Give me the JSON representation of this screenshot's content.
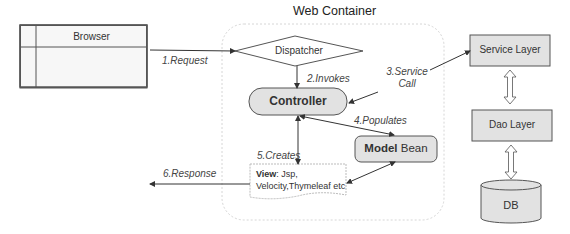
{
  "title": "Web Container",
  "browser": {
    "label": "Browser"
  },
  "dispatcher": {
    "label": "Dispatcher"
  },
  "controller": {
    "label": "Controller"
  },
  "model": {
    "bold": "Model",
    "rest": " Bean"
  },
  "view": {
    "bold": "View",
    "line1": ": Jsp,",
    "line2": "Velocity,Thymeleaf etc"
  },
  "service": {
    "label": "Service Layer"
  },
  "dao": {
    "label": "Dao Layer"
  },
  "db": {
    "label": "DB"
  },
  "steps": {
    "request": "1.Request",
    "invokes": "2.Invokes",
    "service_call_1": "3.Service",
    "service_call_2": "Call",
    "populates": "4.Populates",
    "creates": "5.Creates",
    "response": "6.Response"
  },
  "colors": {
    "box_fill": "#e0e0e0",
    "stroke": "#444444",
    "container_border": "#d0d0d0"
  }
}
